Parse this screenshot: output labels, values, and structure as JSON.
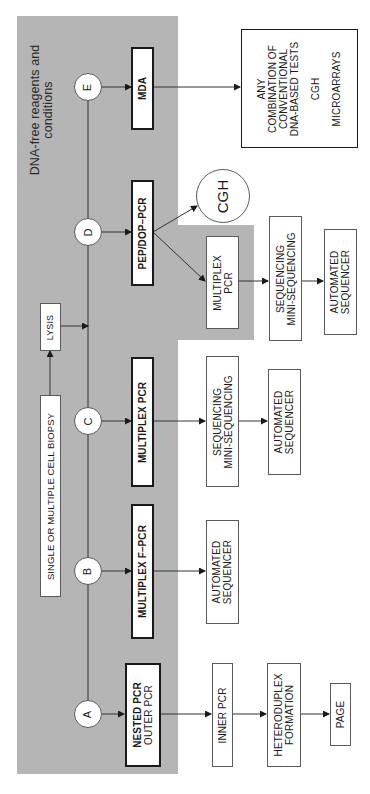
{
  "region": {
    "label_line1": "DNA-free reagents and",
    "label_line2": "conditions",
    "color": "#b5b5b5"
  },
  "start": {
    "biopsy": "SINGLE OR MULTIPLE CELL BIOPSY",
    "lysis": "LYSIS"
  },
  "branches": {
    "A": {
      "label": "A",
      "method_bold": "NESTED PCR",
      "method_sub": "OUTER PCR",
      "steps": [
        "INNER PCR",
        "HETERODUPLEX",
        "FORMATION",
        "PAGE"
      ]
    },
    "B": {
      "label": "B",
      "method": "MULTIPLEX F–PCR",
      "steps": [
        "AUTOMATED",
        "SEQUENCER"
      ]
    },
    "C": {
      "label": "C",
      "method": "MULTIPLEX PCR",
      "steps": [
        "SEQUENCING",
        "MINI-SEQUENCING",
        "AUTOMATED",
        "SEQUENCER"
      ]
    },
    "D": {
      "label": "D",
      "method": "PEP/DOP–PCR",
      "cgh": "CGH",
      "multiplex_line1": "MULTIPLEX",
      "multiplex_line2": "PCR",
      "steps": [
        "SEQUENCING",
        "MINI-SEQUENCING",
        "AUTOMATED",
        "SEQUENCER"
      ]
    },
    "E": {
      "label": "E",
      "method": "MDA",
      "result": [
        "ANY",
        "COMBINATION OF",
        "CONVENTIONAL",
        "DNA-BASED TESTS",
        "CGH",
        "MICROARRAYS"
      ]
    }
  }
}
